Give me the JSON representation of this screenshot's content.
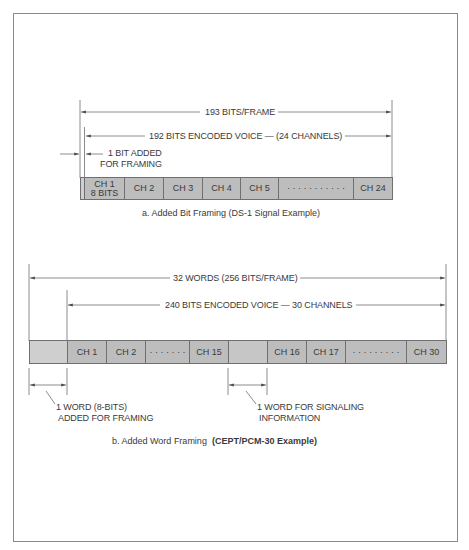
{
  "colors": {
    "bar_fill": "#bdbdbd",
    "bar_fill_light": "#cfcfcf",
    "line": "#6f6f6f",
    "text": "#3a3a3a",
    "border": "#8a8a8a"
  },
  "part_a": {
    "total_label": "193 BITS/FRAME",
    "voice_label": "192 BITS ENCODED VOICE — (24 CHANNELS)",
    "framing_note_line1": "1 BIT ADDED",
    "framing_note_line2": "FOR FRAMING",
    "cells": [
      {
        "id": "framing-bit",
        "label": ""
      },
      {
        "id": "ch1",
        "label": "CH 1",
        "sublabel": "8 BITS"
      },
      {
        "id": "ch2",
        "label": "CH 2"
      },
      {
        "id": "ch3",
        "label": "CH 3"
      },
      {
        "id": "ch4",
        "label": "CH 4"
      },
      {
        "id": "ch5",
        "label": "CH 5"
      },
      {
        "id": "ellipsis",
        "label": "· · · · · · · · · · ·"
      },
      {
        "id": "ch24",
        "label": "CH 24"
      }
    ],
    "caption": "a. Added Bit Framing (DS-1 Signal Example)"
  },
  "part_b": {
    "total_label": "32 WORDS (256 BITS/FRAME)",
    "voice_label": "240 BITS ENCODED VOICE — 30 CHANNELS",
    "cells": [
      {
        "id": "framing-word",
        "label": ""
      },
      {
        "id": "ch1",
        "label": "CH 1"
      },
      {
        "id": "ch2",
        "label": "CH 2"
      },
      {
        "id": "ellipsis-1",
        "label": "· · · · · · ·"
      },
      {
        "id": "ch15",
        "label": "CH 15"
      },
      {
        "id": "signaling-word",
        "label": ""
      },
      {
        "id": "ch16",
        "label": "CH 16"
      },
      {
        "id": "ch17",
        "label": "CH 17"
      },
      {
        "id": "ellipsis-2",
        "label": "· · · · · · · · ·"
      },
      {
        "id": "ch30",
        "label": "CH 30"
      }
    ],
    "framing_note_line1": "1 WORD (8-BITS)",
    "framing_note_line2": "ADDED FOR FRAMING",
    "signaling_note_line1": "1 WORD FOR SIGNALING",
    "signaling_note_line2": "INFORMATION",
    "caption_plain": "b. Added Word Framing",
    "caption_bold": "(CEPT/PCM-30 Example)"
  }
}
